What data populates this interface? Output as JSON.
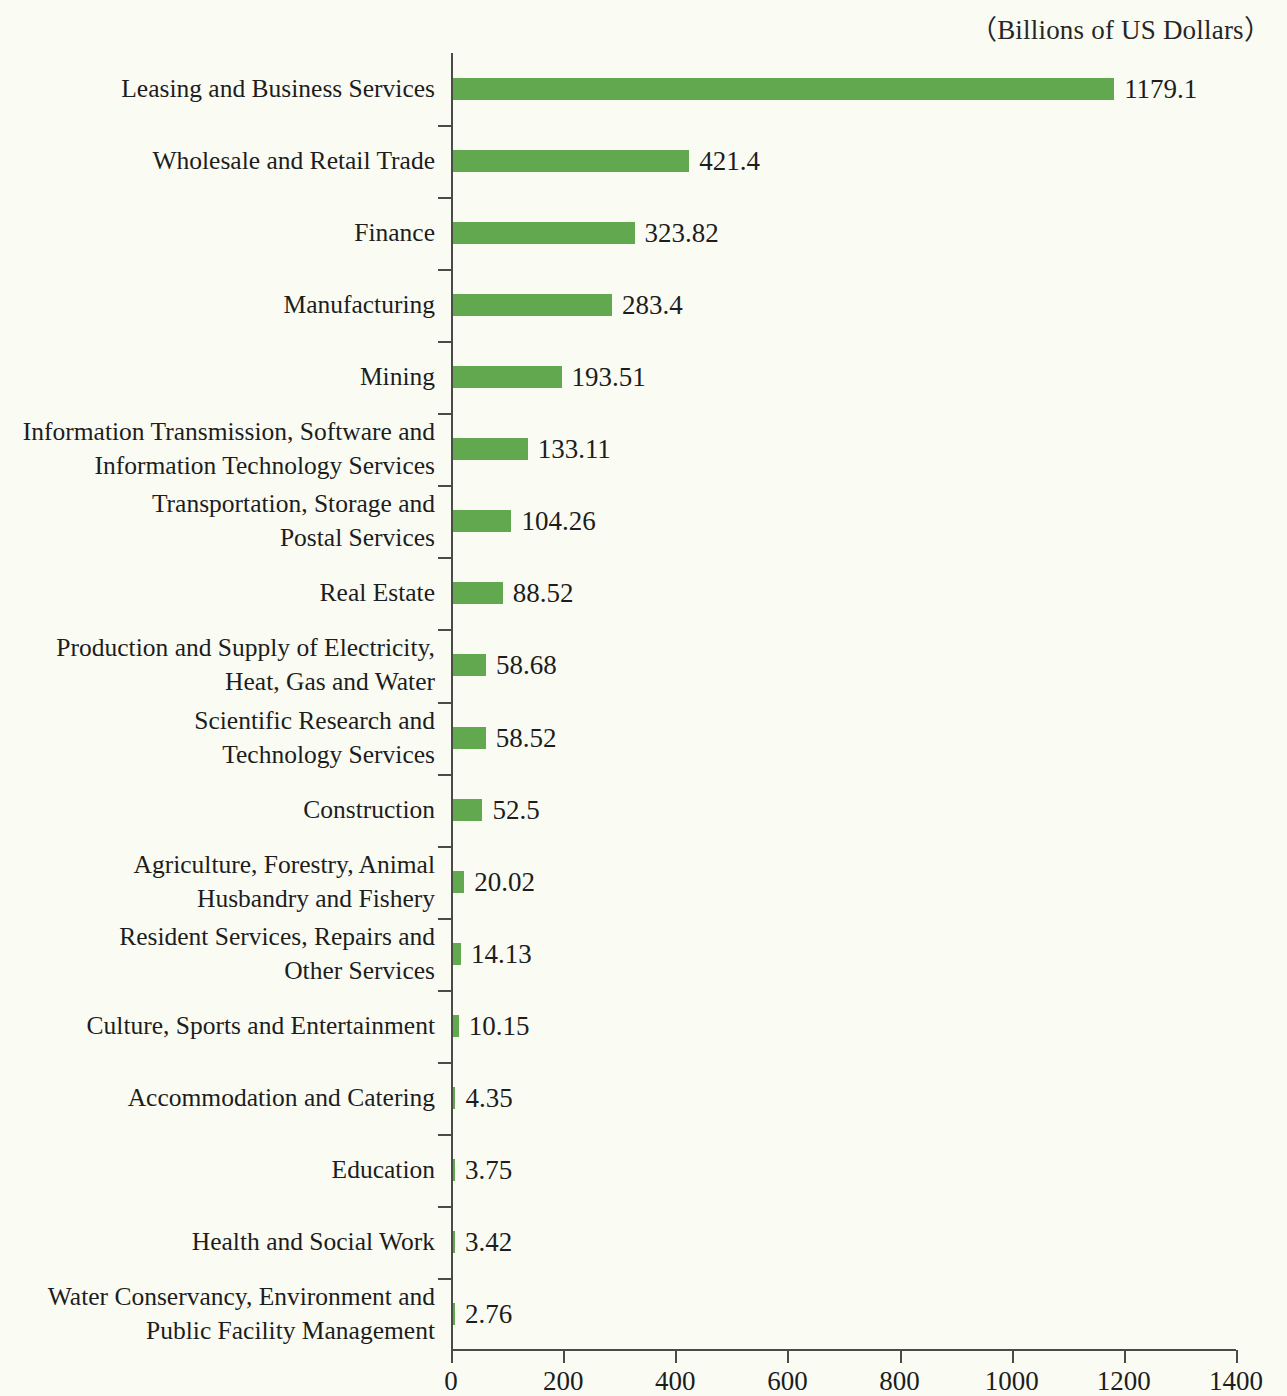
{
  "chart_data": {
    "type": "bar",
    "orientation": "horizontal",
    "title": "（Billions of US Dollars）",
    "xlabel": "",
    "ylabel": "",
    "xlim": [
      0,
      1400
    ],
    "xticks": [
      0,
      200,
      400,
      600,
      800,
      1000,
      1200,
      1400
    ],
    "xtick_labels": [
      "0",
      "200",
      "400",
      "600",
      "800",
      "1000",
      "1200",
      "1400"
    ],
    "grid": false,
    "legend": null,
    "bar_color": "#62a84e",
    "background_color": "#fafcf4",
    "categories": [
      "Leasing and Business Services",
      "Wholesale and Retail Trade",
      "Finance",
      "Manufacturing",
      "Mining",
      "Information Transmission, Software and\nInformation Technology Services",
      "Transportation, Storage and\nPostal Services",
      "Real Estate",
      "Production and Supply of Electricity,\nHeat, Gas and Water",
      "Scientific Research and\nTechnology Services",
      "Construction",
      "Agriculture, Forestry, Animal\nHusbandry and Fishery",
      "Resident Services, Repairs and\nOther Services",
      "Culture, Sports and Entertainment",
      "Accommodation and Catering",
      "Education",
      "Health and Social Work",
      "Water Conservancy, Environment and\nPublic Facility Management"
    ],
    "values": [
      1179.1,
      421.4,
      323.82,
      283.4,
      193.51,
      133.11,
      104.26,
      88.52,
      58.68,
      58.52,
      52.5,
      20.02,
      14.13,
      10.15,
      4.35,
      3.75,
      3.42,
      2.76
    ],
    "value_labels": [
      "1179.1",
      "421.4",
      "323.82",
      "283.4",
      "193.51",
      "133.11",
      "104.26",
      "88.52",
      "58.68",
      "58.52",
      "52.5",
      "20.02",
      "14.13",
      "10.15",
      "4.35",
      "3.75",
      "3.42",
      "2.76"
    ]
  }
}
